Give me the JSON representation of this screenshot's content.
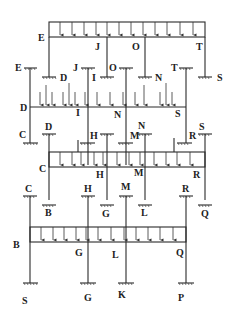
{
  "diagram": {
    "title": "",
    "colors": {
      "line": "#2a2a2a",
      "text": "#222222",
      "background": "#ffffff"
    },
    "tiers": [
      {
        "id": "tier-1",
        "beam_labels": {
          "left": "E",
          "j": "J",
          "o": "O",
          "right": "T"
        }
      },
      {
        "id": "tier-2",
        "support_labels": [
          "E",
          "D",
          "J",
          "I",
          "O",
          "N",
          "T",
          "S"
        ],
        "beam_labels": {
          "left": "D",
          "i": "I",
          "n": "N",
          "right": "S"
        }
      },
      {
        "id": "tier-3",
        "support_labels": [
          "C",
          "D",
          "H",
          "N",
          "M",
          "R",
          "S"
        ],
        "beam_labels": {
          "left": "C",
          "h": "H",
          "m": "M",
          "right": "R"
        }
      },
      {
        "id": "tier-4",
        "support_labels": [
          "C",
          "B",
          "H",
          "G",
          "M",
          "L",
          "R",
          "Q"
        ],
        "beam_labels": {
          "left": "B",
          "g": "G",
          "l": "L",
          "right": "Q"
        },
        "base_labels": [
          "S",
          "G",
          "K",
          "P"
        ]
      }
    ]
  }
}
